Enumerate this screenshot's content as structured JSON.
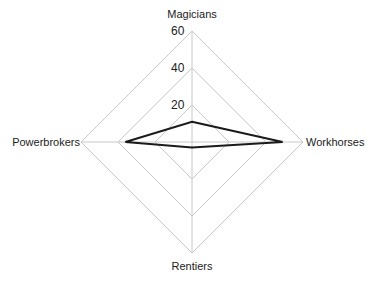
{
  "chart_data": {
    "type": "radar",
    "title": "",
    "axes": [
      "Magicians",
      "Workhorses",
      "Rentiers",
      "Powerbrokers"
    ],
    "series": [
      {
        "name": "",
        "values": [
          11,
          49,
          3,
          36
        ],
        "color": "#1a1a1a"
      }
    ],
    "rlim": [
      0,
      60
    ],
    "ticks": [
      20,
      40,
      60
    ],
    "tick_labels": [
      "20",
      "40",
      "60"
    ],
    "grid": true,
    "grid_color": "#c8c8c8",
    "legend": null
  },
  "labels": {
    "axis_0": "Magicians",
    "axis_1": "Workhorses",
    "axis_2": "Rentiers",
    "axis_3": "Powerbrokers",
    "tick_20": "20",
    "tick_40": "40",
    "tick_60": "60"
  }
}
